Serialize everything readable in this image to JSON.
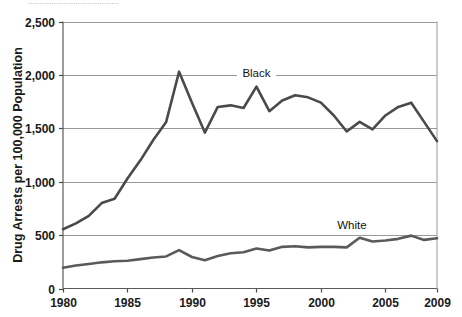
{
  "chart_data": {
    "type": "line",
    "title": "",
    "xlabel": "",
    "ylabel": "Drug Arrests per 100,000 Population",
    "xlim": [
      1980,
      2009
    ],
    "ylim": [
      0,
      2500
    ],
    "grid": true,
    "legend_position": "inline-annotation",
    "x_tick_labels": [
      "1980",
      "1985",
      "1990",
      "1995",
      "2000",
      "2005",
      "2009"
    ],
    "x_ticks": [
      1980,
      1985,
      1990,
      1995,
      2000,
      2005,
      2009
    ],
    "y_tick_labels": [
      "0",
      "500",
      "1,000",
      "1,500",
      "2,000",
      "2,500"
    ],
    "y_ticks": [
      0,
      500,
      1000,
      1500,
      2000,
      2500
    ],
    "x": [
      1980,
      1981,
      1982,
      1983,
      1984,
      1985,
      1986,
      1987,
      1988,
      1989,
      1990,
      1991,
      1992,
      1993,
      1994,
      1995,
      1996,
      1997,
      1998,
      1999,
      2000,
      2001,
      2002,
      2003,
      2004,
      2005,
      2006,
      2007,
      2008,
      2009
    ],
    "series": [
      {
        "name": "Black",
        "color": "#4a4a4a",
        "label_text": "Black",
        "values": [
          555,
          610,
          680,
          800,
          840,
          1030,
          1200,
          1390,
          1560,
          2030,
          1740,
          1460,
          1700,
          1715,
          1690,
          1890,
          1660,
          1760,
          1810,
          1790,
          1740,
          1620,
          1470,
          1560,
          1490,
          1620,
          1700,
          1740,
          1560,
          1380
        ]
      },
      {
        "name": "White",
        "color": "#5a5a5a",
        "label_text": "White",
        "values": [
          195,
          215,
          230,
          245,
          255,
          260,
          275,
          290,
          300,
          360,
          295,
          265,
          305,
          330,
          340,
          375,
          355,
          390,
          395,
          385,
          390,
          390,
          385,
          475,
          440,
          450,
          465,
          495,
          455,
          470
        ]
      }
    ],
    "annotations": [
      {
        "text": "Black",
        "x": 1995,
        "y": 1985
      },
      {
        "text": "White",
        "x": 2002.4,
        "y": 560
      }
    ]
  },
  "axis": {
    "y_axis_title": "Drug Arrests per 100,000 Population"
  }
}
